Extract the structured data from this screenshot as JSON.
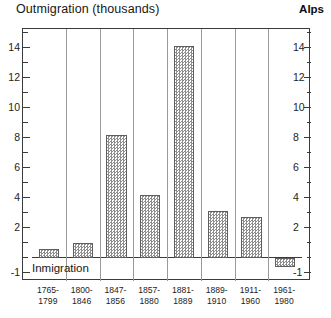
{
  "titles": {
    "y_axis_title": "Outmigration (thousands)",
    "region": "Alps",
    "baseline_caption": "Inmigration"
  },
  "axis": {
    "y_labels": [
      "14",
      "12",
      "10",
      "8",
      "6",
      "4",
      "2",
      "-1"
    ],
    "y_labels_right": [
      "14",
      "12",
      "10",
      "8",
      "6",
      "4",
      "2",
      "-1"
    ],
    "y_min": -1,
    "y_max": 15
  },
  "chart_data": {
    "type": "bar",
    "title": "Outmigration (thousands)",
    "subtitle": "Alps",
    "xlabel": "",
    "ylabel": "Outmigration (thousands)",
    "ylim": [
      -1,
      15
    ],
    "yticks": [
      -1,
      2,
      4,
      6,
      8,
      10,
      12,
      14
    ],
    "grid": "vertical category separators only",
    "legend": "none",
    "annotations": [
      "Outmigration (thousands)",
      "Inmigration",
      "Alps"
    ],
    "categories": [
      "1765-\n1799",
      "1800-\n1846",
      "1847-\n1856",
      "1857-\n1880",
      "1881-\n1889",
      "1889-\n1910",
      "1911-\n1960",
      "1961-\n1980"
    ],
    "category_lines": [
      [
        "1765-",
        "1799"
      ],
      [
        "1800-",
        "1846"
      ],
      [
        "1847-",
        "1856"
      ],
      [
        "1857-",
        "1880"
      ],
      [
        "1881-",
        "1889"
      ],
      [
        "1889-",
        "1910"
      ],
      [
        "1911-",
        "1960"
      ],
      [
        "1961-",
        "1980"
      ]
    ],
    "values": [
      0.6,
      1.0,
      8.2,
      4.2,
      14.1,
      3.1,
      2.7,
      -0.6
    ]
  },
  "style": {
    "bar_fill": "#8e8e8e",
    "bar_edge": "#5e5e5e",
    "frame_color": "#3b3b3b",
    "separator_color": "#9a9a9a",
    "text_color": "#1d1d1d",
    "background": "#ffffff"
  }
}
